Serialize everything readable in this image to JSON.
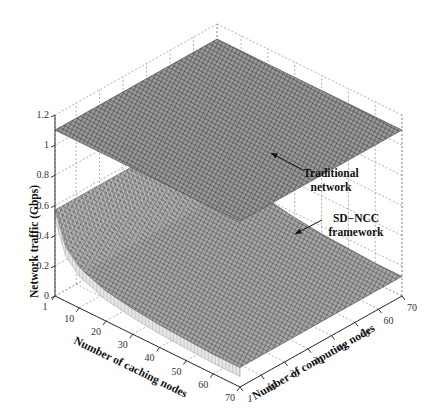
{
  "chart_data": {
    "type": "surface3d",
    "title": "",
    "xlabel": "Number of caching nodes",
    "ylabel": "Number of computing nodes",
    "zlabel": "Network traffic (Gbps)",
    "x_ticks": [
      "1",
      "10",
      "20",
      "30",
      "40",
      "50",
      "60",
      "70"
    ],
    "y_ticks": [
      "1",
      "10",
      "20",
      "30",
      "40",
      "50",
      "60",
      "70"
    ],
    "z_ticks": [
      "0",
      "0.2",
      "0.4",
      "0.6",
      "0.8",
      "1",
      "1.2"
    ],
    "xlim": [
      1,
      70
    ],
    "ylim": [
      1,
      70
    ],
    "zlim": [
      0,
      1.2
    ],
    "grid": true,
    "series": [
      {
        "name": "Traditional network",
        "description": "flat plane",
        "z_constant": 1.1
      },
      {
        "name": "SD-NCC framework",
        "description": "decreasing with number of caching nodes, nearly flat across computing nodes",
        "x": [
          1,
          5,
          10,
          20,
          30,
          40,
          50,
          60,
          70
        ],
        "z": [
          0.57,
          0.36,
          0.27,
          0.2,
          0.17,
          0.15,
          0.14,
          0.13,
          0.13
        ]
      }
    ],
    "annotations": [
      {
        "text": [
          "Traditional",
          "network"
        ],
        "target": "Traditional network"
      },
      {
        "text": [
          "SD−NCC",
          "framework"
        ],
        "target": "SD-NCC framework"
      }
    ]
  },
  "colors": {
    "upper_mesh": "#4a4a4a",
    "upper_fill": "#8a8a8a",
    "lower_mesh": "#555555",
    "lower_fill": "#9a9a9a",
    "grid": "#9a9a9a",
    "axis": "#333333"
  }
}
